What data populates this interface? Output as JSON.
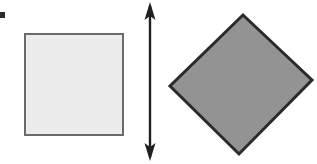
{
  "figure": {
    "title": "Square and rotated square joined by a vertical double-headed arrow",
    "caption": "",
    "width": 317,
    "height": 164,
    "background_color": "#ffffff"
  },
  "marks": {
    "corner_tick": {
      "name": "corner-tick-mark",
      "x": 0,
      "y": 12,
      "width": 5,
      "height": 6,
      "color": "#2b2b2b",
      "label": ""
    }
  },
  "shapes": [
    {
      "id": "light-square",
      "kind": "square",
      "label": "",
      "x": 24,
      "y": 33,
      "width": 100,
      "height": 103,
      "rotation_deg": 0,
      "fill_color": "#ececec",
      "stroke_color": "#6a6a6a",
      "stroke_width": 2
    },
    {
      "id": "gray-diamond",
      "kind": "square-rotated",
      "label": "",
      "rotation_deg": 45,
      "fill_color": "#939393",
      "stroke_color": "#2a2a2a",
      "stroke_width": 3,
      "vertices": [
        {
          "name": "top",
          "x": 243,
          "y": 15
        },
        {
          "name": "right",
          "x": 312,
          "y": 80
        },
        {
          "name": "bottom",
          "x": 239,
          "y": 154
        },
        {
          "name": "left",
          "x": 170,
          "y": 86
        }
      ]
    }
  ],
  "arrow": {
    "id": "vertical-double-arrow",
    "label": "",
    "color": "#1f1f1f",
    "shaft_x": 150,
    "top_y": 2,
    "bottom_y": 161,
    "shaft_width": 2,
    "head_width": 11,
    "head_length": 17,
    "double_headed": true
  }
}
